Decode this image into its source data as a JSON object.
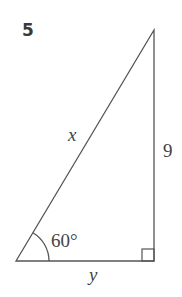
{
  "problem": {
    "number": "5",
    "figure": {
      "type": "right-triangle",
      "labels": {
        "hypotenuse": "x",
        "vertical_side": "9",
        "base": "y",
        "angle": "60°"
      },
      "right_angle_marker": true,
      "stroke_color": "#555555"
    }
  }
}
